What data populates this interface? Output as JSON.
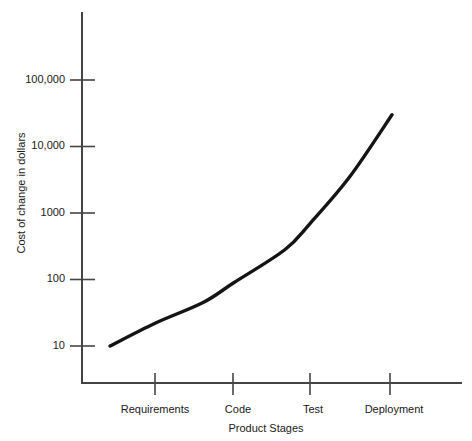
{
  "chart_data": {
    "type": "line",
    "title": "",
    "xlabel": "Product Stages",
    "ylabel": "Cost of change in dollars",
    "y_scale": "log",
    "ylim": [
      10,
      100000
    ],
    "grid": false,
    "legend": "none",
    "y_ticks": [
      {
        "value": 10,
        "label": "10"
      },
      {
        "value": 100,
        "label": "100"
      },
      {
        "value": 1000,
        "label": "1000"
      },
      {
        "value": 10000,
        "label": "10,000"
      },
      {
        "value": 100000,
        "label": "100,000"
      }
    ],
    "categories": [
      "Requirements",
      "Code",
      "Test",
      "Deployment"
    ],
    "series": [
      {
        "name": "Cost of change",
        "values": [
          22,
          90,
          700,
          30000
        ]
      }
    ],
    "curve_points": [
      {
        "stage": "",
        "x_frac": 0.0,
        "value": 10
      },
      {
        "stage": "Requirements",
        "x_frac": 0.16,
        "value": 22
      },
      {
        "stage": "",
        "x_frac": 0.33,
        "value": 45
      },
      {
        "stage": "Code",
        "x_frac": 0.44,
        "value": 90
      },
      {
        "stage": "",
        "x_frac": 0.62,
        "value": 280
      },
      {
        "stage": "Test",
        "x_frac": 0.71,
        "value": 700
      },
      {
        "stage": "",
        "x_frac": 0.85,
        "value": 3500
      },
      {
        "stage": "Deployment",
        "x_frac": 1.0,
        "value": 30000
      }
    ],
    "colors": {
      "curve": "#141414",
      "axis": "#444444",
      "text": "#1a1a1a",
      "background": "#ffffff"
    }
  }
}
